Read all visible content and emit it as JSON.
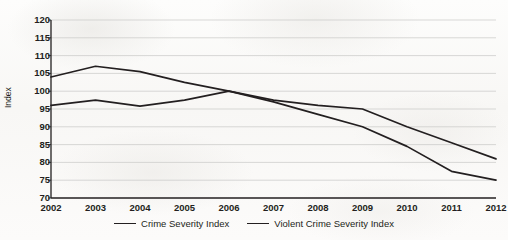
{
  "chart_data": {
    "type": "line",
    "title": "",
    "subtitle": "",
    "xlabel": "",
    "ylabel": "Index",
    "categories": [
      "2002",
      "2003",
      "2004",
      "2005",
      "2006",
      "2007",
      "2008",
      "2009",
      "2010",
      "2011",
      "2012"
    ],
    "x": [
      2002,
      2003,
      2004,
      2005,
      2006,
      2007,
      2008,
      2009,
      2010,
      2011,
      2012
    ],
    "ylim": [
      70,
      120
    ],
    "yticks": [
      70,
      75,
      80,
      85,
      90,
      95,
      100,
      105,
      110,
      115,
      120
    ],
    "grid": true,
    "legend_position": "bottom",
    "series": [
      {
        "name": "Crime Severity Index",
        "color": "#231f20",
        "values": [
          104,
          107,
          105.5,
          102.5,
          100,
          97.5,
          96,
          95,
          90,
          85.5,
          81
        ]
      },
      {
        "name": "Violent Crime Severity Index",
        "color": "#231f20",
        "values": [
          96,
          97.5,
          95.8,
          97.5,
          100,
          97,
          93.5,
          90,
          84.5,
          77.5,
          75
        ]
      }
    ]
  },
  "legend": {
    "items": [
      {
        "label": "Crime Severity Index"
      },
      {
        "label": "Violent Crime Severity Index"
      }
    ]
  },
  "colors": {
    "line": "#231f20",
    "gridline": "#c9c9c7",
    "axis": "#231f20",
    "background": "#fbfbfa"
  }
}
